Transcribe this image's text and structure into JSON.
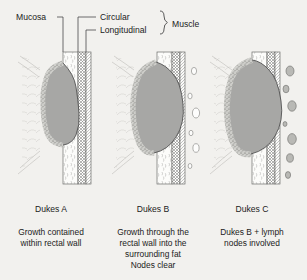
{
  "figure": {
    "title_labels": {
      "mucosa": "Mucosa",
      "circular": "Circular",
      "longitudinal": "Longitudinal",
      "muscle": "Muscle"
    },
    "panels": [
      {
        "id": "dukes-a",
        "stage": "Dukes A",
        "caption_lines": [
          "Growth contained",
          "within rectal wall"
        ],
        "nodes": [],
        "nodes_state": "none"
      },
      {
        "id": "dukes-b",
        "stage": "Dukes B",
        "caption_lines": [
          "Growth through the",
          "rectal wall into the",
          "surrounding fat",
          "Nodes clear"
        ],
        "nodes_state": "clear"
      },
      {
        "id": "dukes-c",
        "stage": "Dukes C",
        "caption_lines": [
          "Dukes B + lymph",
          "nodes involved"
        ],
        "nodes_state": "involved"
      }
    ],
    "colors": {
      "background": "#f2f1ee",
      "tumor_fill": "#a7a7a5",
      "tumor_stroke": "#4c4c4c",
      "wall_fill": "#fbfbf9",
      "muscle_hatch": "#6f6f6f",
      "node_clear_fill": "#fdfdfc",
      "node_involved_fill": "#b9b9b5",
      "text": "#1b1b1b",
      "leader_line": "#4a4a4a"
    }
  }
}
